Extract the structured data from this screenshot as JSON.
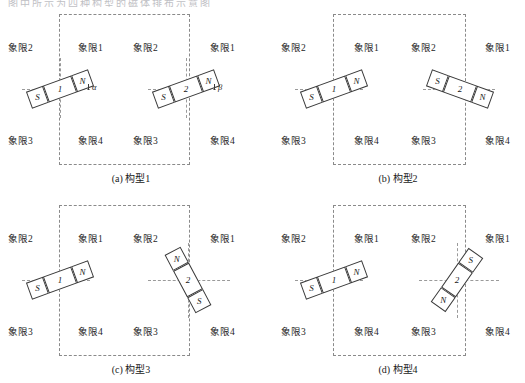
{
  "figure": {
    "truncated_header_text": "图中所示为四种构型的磁体排布示意图",
    "quadrant_labels": {
      "q1": "象限1",
      "q2": "象限2",
      "q3": "象限3",
      "q4": "象限4"
    },
    "pole_labels": {
      "north": "N",
      "south": "S"
    },
    "magnet_ids": {
      "left": "1",
      "right": "2"
    },
    "angles": {
      "alpha": "α",
      "beta": "β"
    }
  },
  "panels": [
    {
      "key": "a",
      "caption": "(a) 构型1",
      "left_magnet": {
        "id": "1",
        "tip_label": "N",
        "tail_label": "S",
        "angle_deg": -20,
        "angle_symbol": "α"
      },
      "right_magnet": {
        "id": "2",
        "tip_label": "N",
        "tail_label": "S",
        "angle_deg": -20,
        "angle_symbol": "β"
      },
      "quadrants_left": [
        "象限2",
        "象限1",
        "象限3",
        "象限4"
      ],
      "quadrants_right": [
        "象限2",
        "象限1",
        "象限3",
        "象限4"
      ]
    },
    {
      "key": "b",
      "caption": "(b) 构型2",
      "left_magnet": {
        "id": "1",
        "tip_label": "N",
        "tail_label": "S",
        "angle_deg": -20,
        "angle_symbol": ""
      },
      "right_magnet": {
        "id": "2",
        "tip_label": "N",
        "tail_label": "S",
        "angle_deg": 20,
        "angle_symbol": ""
      },
      "quadrants_left": [
        "象限2",
        "象限1",
        "象限3",
        "象限4"
      ],
      "quadrants_right": [
        "象限2",
        "象限1",
        "象限3",
        "象限4"
      ]
    },
    {
      "key": "c",
      "caption": "(c) 构型3",
      "left_magnet": {
        "id": "1",
        "tip_label": "N",
        "tail_label": "S",
        "angle_deg": -20,
        "angle_symbol": ""
      },
      "right_magnet": {
        "id": "2",
        "tip_label": "S",
        "tail_label": "N",
        "angle_deg": 62,
        "angle_symbol": ""
      },
      "quadrants_left": [
        "象限2",
        "象限1",
        "象限3",
        "象限4"
      ],
      "quadrants_right": [
        "象限2",
        "象限1",
        "象限3",
        "象限4"
      ]
    },
    {
      "key": "d",
      "caption": "(d) 构型4",
      "left_magnet": {
        "id": "1",
        "tip_label": "N",
        "tail_label": "S",
        "angle_deg": -20,
        "angle_symbol": ""
      },
      "right_magnet": {
        "id": "2",
        "tip_label": "S",
        "tail_label": "N",
        "angle_deg": -55,
        "angle_symbol": ""
      },
      "quadrants_left": [
        "象限2",
        "象限1",
        "象限3",
        "象限4"
      ],
      "quadrants_right": [
        "象限2",
        "象限1",
        "象限3",
        "象限4"
      ]
    }
  ],
  "colors": {
    "stroke": "#3a3a3a",
    "dash": "#8a8a8a",
    "text": "#1a1a1a",
    "background": "#ffffff"
  }
}
